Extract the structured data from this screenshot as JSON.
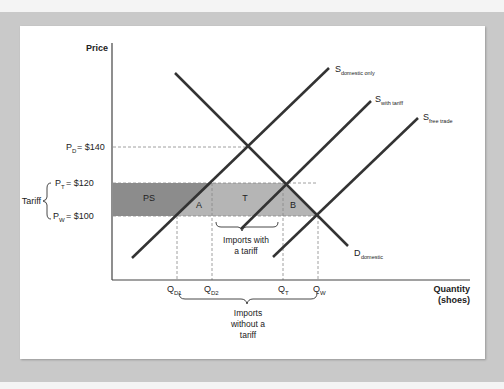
{
  "axes": {
    "y_label": "Price",
    "x_label_line1": "Quantity",
    "x_label_line2": "(shoes)"
  },
  "price_labels": {
    "pd": {
      "main": "P",
      "sub": "D",
      "value": "= $140"
    },
    "pt": {
      "main": "P",
      "sub": "T",
      "value": "= $120"
    },
    "pw": {
      "main": "P",
      "sub": "W",
      "value": "= $100"
    },
    "tariff": "Tariff"
  },
  "quantity_labels": {
    "qd1": {
      "main": "Q",
      "sub": "D1"
    },
    "qd2": {
      "main": "Q",
      "sub": "D2"
    },
    "qt": {
      "main": "Q",
      "sub": "T"
    },
    "qw": {
      "main": "Q",
      "sub": "W"
    }
  },
  "curves": {
    "s_domestic": {
      "main": "S",
      "sub": "domestic only"
    },
    "s_tariff": {
      "main": "S",
      "sub": "with tariff"
    },
    "s_free": {
      "main": "S",
      "sub": "free trade"
    },
    "d_domestic": {
      "main": "D",
      "sub": "domestic"
    }
  },
  "areas": {
    "ps": "PS",
    "a": "A",
    "t": "T",
    "b": "B"
  },
  "annotations": {
    "imports_tariff_1": "Imports with",
    "imports_tariff_2": "a tariff",
    "imports_free_1": "Imports",
    "imports_free_2": "without a",
    "imports_free_3": "tariff"
  },
  "colors": {
    "ps_fill": "#8c8c8c",
    "light_fill": "#b5b5b5",
    "line": "#333333"
  }
}
